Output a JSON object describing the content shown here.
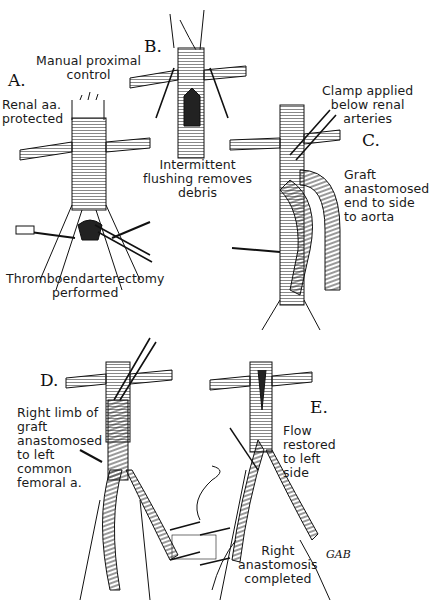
{
  "figure": {
    "colors": {
      "ink": "#111111",
      "background": "#ffffff",
      "hatch": "#555555"
    },
    "panels": [
      {
        "id": "A",
        "label": "A.",
        "annotations": [
          {
            "id": "manual-control",
            "text": "Manual proximal\ncontrol"
          },
          {
            "id": "renal-protected",
            "text": "Renal aa.\nprotected"
          },
          {
            "id": "thrombo",
            "text": "Thromboendarterectomy\nperformed"
          }
        ]
      },
      {
        "id": "B",
        "label": "B.",
        "annotations": [
          {
            "id": "flushing",
            "text": "Intermittent\nflushing removes\ndebris"
          }
        ]
      },
      {
        "id": "C",
        "label": "C.",
        "annotations": [
          {
            "id": "clamp",
            "text": "Clamp applied\nbelow renal\narteries"
          },
          {
            "id": "graft",
            "text": "Graft\nanastomosed\nend to side\nto aorta"
          }
        ]
      },
      {
        "id": "D",
        "label": "D.",
        "annotations": [
          {
            "id": "right-limb",
            "text": "Right limb of\ngraft\nanastomosed\nto left\ncommon\nfemoral a."
          }
        ]
      },
      {
        "id": "E",
        "label": "E.",
        "annotations": [
          {
            "id": "flow",
            "text": "Flow\nrestored\nto left\nside"
          },
          {
            "id": "right-anast",
            "text": "Right\nanastomosis\ncompleted"
          }
        ]
      }
    ],
    "signature": "GAB"
  }
}
